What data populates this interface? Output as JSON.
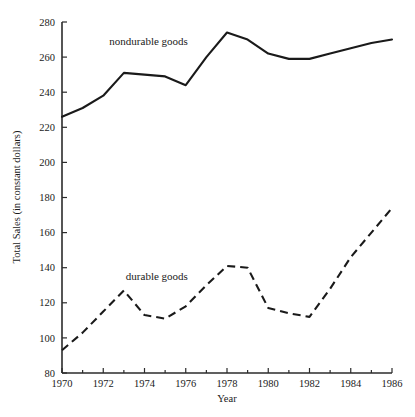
{
  "chart_data": {
    "type": "line",
    "title": "",
    "xlabel": "Year",
    "ylabel": "Total Sales (in constant dollars)",
    "x": [
      1970,
      1971,
      1972,
      1973,
      1974,
      1975,
      1976,
      1977,
      1978,
      1979,
      1980,
      1981,
      1982,
      1983,
      1984,
      1985,
      1986
    ],
    "xlim": [
      1970,
      1986
    ],
    "ylim": [
      80,
      280
    ],
    "xticks": [
      1970,
      1972,
      1974,
      1976,
      1978,
      1980,
      1982,
      1984,
      1986
    ],
    "xtick_labels": [
      "1970",
      "1972",
      "1974",
      "1976",
      "1978",
      "1980",
      "1982",
      "1984",
      "1986"
    ],
    "xminorticks": [
      1971,
      1973,
      1975,
      1977,
      1979,
      1981,
      1983,
      1985
    ],
    "yticks": [
      80,
      100,
      120,
      140,
      160,
      180,
      200,
      220,
      240,
      260,
      280
    ],
    "ytick_labels": [
      "80",
      "100",
      "120",
      "140",
      "160",
      "180",
      "200",
      "220",
      "240",
      "260",
      "280"
    ],
    "grid": false,
    "legend_position": "inline-annotation",
    "series": [
      {
        "name": "nondurable goods",
        "style": "solid",
        "color": "#1a1a1a",
        "label_x": 1974.2,
        "label_y": 267,
        "values": [
          226,
          231,
          238,
          251,
          250,
          249,
          244,
          260,
          274,
          270,
          262,
          259,
          259,
          262,
          265,
          268,
          270
        ]
      },
      {
        "name": "durable goods",
        "style": "dashed",
        "color": "#1a1a1a",
        "label_x": 1974.6,
        "label_y": 133,
        "values": [
          93,
          103,
          115,
          127,
          113,
          111,
          118,
          130,
          141,
          140,
          117,
          114,
          112,
          128,
          146,
          160,
          174
        ]
      }
    ]
  },
  "caption": {
    "text": ""
  }
}
